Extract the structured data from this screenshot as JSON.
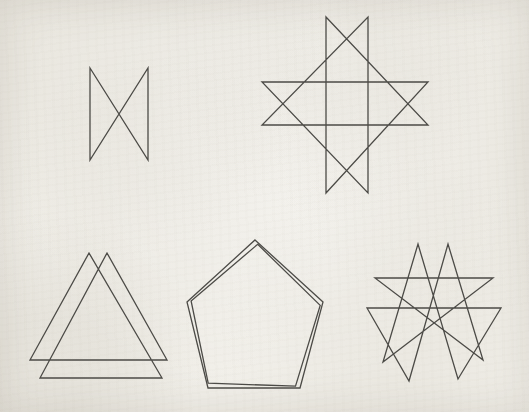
{
  "page": {
    "width": 529,
    "height": 412,
    "paper_color": "#f1efe9",
    "ink_color": "#4b4a46",
    "stroke_width": 1.3
  },
  "figures": [
    {
      "id": "crossed-rectangle-figure",
      "label": "bow-tie crossed rectangle",
      "polygons": [
        [
          [
            90,
            68
          ],
          [
            148,
            160
          ],
          [
            148,
            68
          ],
          [
            90,
            160
          ]
        ]
      ]
    },
    {
      "id": "octagram-star-figure",
      "label": "eight-pointed star polygon",
      "polygons": [
        [
          [
            326,
            17
          ],
          [
            428,
            125
          ],
          [
            262,
            125
          ],
          [
            368,
            17
          ],
          [
            368,
            193
          ],
          [
            262,
            82
          ],
          [
            428,
            82
          ],
          [
            326,
            193
          ]
        ]
      ]
    },
    {
      "id": "overlapping-triangles-figure",
      "label": "crossed hexagon of two overlapping triangles",
      "polygons": [
        [
          [
            89,
            253
          ],
          [
            30,
            360
          ],
          [
            167,
            360
          ],
          [
            107,
            253
          ],
          [
            40,
            378
          ],
          [
            162,
            378
          ]
        ]
      ]
    },
    {
      "id": "double-outline-pentagon-figure",
      "label": "pentagon traced twice with doubled outline",
      "polygons": [
        [
          [
            255,
            240
          ],
          [
            323,
            302
          ],
          [
            300,
            388
          ],
          [
            208,
            388
          ],
          [
            187,
            302
          ]
        ],
        [
          [
            257.7,
            244.3
          ],
          [
            320.2,
            305.4
          ],
          [
            295.5,
            386.2
          ],
          [
            208.2,
            383.2
          ],
          [
            191.1,
            300.9
          ]
        ]
      ]
    },
    {
      "id": "double-pentagram-star-figure",
      "label": "ten-pointed star of two overlapping pentagram traces",
      "polygons": [
        [
          [
            375,
            278
          ],
          [
            493,
            278
          ],
          [
            383,
            362
          ],
          [
            418,
            244
          ],
          [
            458,
            379
          ],
          [
            501,
            308
          ],
          [
            367,
            308
          ],
          [
            409,
            381
          ],
          [
            448,
            244
          ],
          [
            483,
            360
          ]
        ]
      ]
    }
  ]
}
